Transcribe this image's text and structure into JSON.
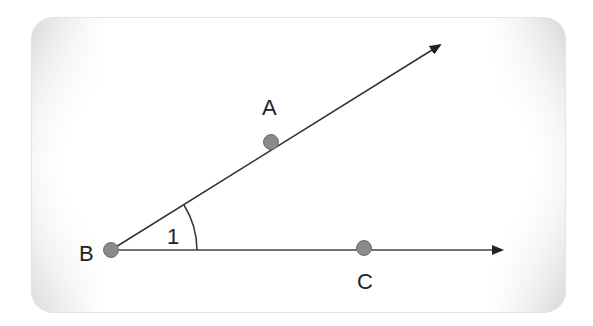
{
  "diagram": {
    "type": "angle",
    "vertex": {
      "label": "B",
      "x": 111,
      "y": 250
    },
    "points": [
      {
        "label": "A",
        "x": 271,
        "y": 142
      },
      {
        "label": "C",
        "x": 364,
        "y": 249
      }
    ],
    "rays": [
      {
        "from": "B",
        "through": "A",
        "end": {
          "x": 440,
          "y": 45
        }
      },
      {
        "from": "B",
        "through": "C",
        "end": {
          "x": 502,
          "y": 250
        }
      }
    ],
    "angle_label": "1",
    "labels": {
      "A": "A",
      "B": "B",
      "C": "C",
      "angle": "1"
    },
    "colors": {
      "line": "#333333",
      "point_fill": "#8a8a8a",
      "point_stroke": "#6f6f6f",
      "panel_edge": "#d9d9d9",
      "text": "#222222"
    }
  }
}
